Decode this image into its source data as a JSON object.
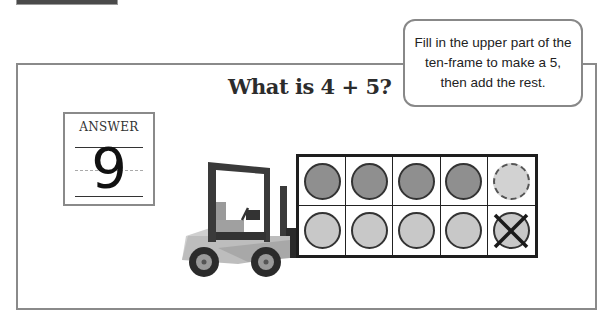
{
  "question": {
    "title": "What is 4 + 5?"
  },
  "hint_bubble": {
    "lines": [
      "Fill in the upper part of the",
      "ten-frame to make a 5,",
      "then add the rest."
    ]
  },
  "answer": {
    "label": "ANSWER",
    "value": "9"
  },
  "ten_frame": {
    "rows": 2,
    "cols": 5,
    "cells": [
      {
        "state": "filled-dark"
      },
      {
        "state": "filled-dark"
      },
      {
        "state": "filled-dark"
      },
      {
        "state": "filled-dark"
      },
      {
        "state": "moved-dashed"
      },
      {
        "state": "filled-light"
      },
      {
        "state": "filled-light"
      },
      {
        "state": "filled-light"
      },
      {
        "state": "filled-light"
      },
      {
        "state": "crossed-out"
      }
    ]
  },
  "illustration": {
    "vehicle": "forklift-icon"
  },
  "colors": {
    "frame_border": "#8a8a8a",
    "counter_dark": "#8f8f8f",
    "counter_light": "#c8c8c8",
    "ten_frame_border": "#1e1e1e"
  }
}
